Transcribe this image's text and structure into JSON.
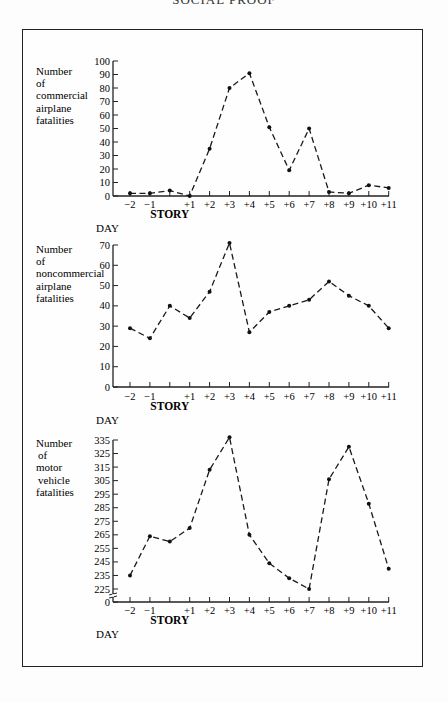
{
  "header": {
    "running_title": "SOCIAL PROOF"
  },
  "x_axis": {
    "tick_labels": [
      "−2",
      "−1",
      "",
      "+1",
      "+2",
      "+3",
      "+4",
      "+5",
      "+6",
      "+7",
      "+8",
      "+9",
      "+10",
      "+11"
    ],
    "day_values": [
      -2,
      -1,
      0,
      1,
      2,
      3,
      4,
      5,
      6,
      7,
      8,
      9,
      10,
      11
    ],
    "story_label": "STORY",
    "day_label": "DAY"
  },
  "charts": [
    {
      "y_label_lines": [
        "Number",
        "of",
        "commercial",
        "airplane",
        "fatalities"
      ],
      "y_ticks": [
        "100",
        "90",
        "80",
        "70",
        "60",
        "50",
        "40",
        "30",
        "20",
        "10",
        "0"
      ]
    },
    {
      "y_label_lines": [
        "Number",
        "of",
        "noncommercial",
        "airplane",
        "fatalities"
      ],
      "y_ticks": [
        "70",
        "60",
        "50",
        "40",
        "30",
        "20",
        "10",
        "0"
      ]
    },
    {
      "y_label_lines": [
        "Number",
        "of",
        "motor",
        "vehicle",
        "fatalities"
      ],
      "y_ticks": [
        "335",
        "325",
        "315",
        "305",
        "295",
        "285",
        "275",
        "265",
        "255",
        "245",
        "235",
        "225",
        "0"
      ]
    }
  ],
  "chart_data": [
    {
      "type": "line",
      "title": "",
      "xlabel": "DAY",
      "ylabel": "Number of commercial airplane fatalities",
      "x": [
        -2,
        -1,
        0,
        1,
        2,
        3,
        4,
        5,
        6,
        7,
        8,
        9,
        10,
        11
      ],
      "x_tick_labels": [
        "−2",
        "−1",
        "STORY",
        "+1",
        "+2",
        "+3",
        "+4",
        "+5",
        "+6",
        "+7",
        "+8",
        "+9",
        "+10",
        "+11"
      ],
      "series": [
        {
          "name": "Commercial airplane fatalities",
          "values": [
            2,
            2,
            4,
            0,
            35,
            80,
            91,
            51,
            19,
            50,
            3,
            2,
            8,
            6
          ]
        }
      ],
      "ylim": [
        0,
        100
      ],
      "grid": false,
      "line_style": "dashed with point markers"
    },
    {
      "type": "line",
      "title": "",
      "xlabel": "DAY",
      "ylabel": "Number of noncommercial airplane fatalities",
      "x": [
        -2,
        -1,
        0,
        1,
        2,
        3,
        4,
        5,
        6,
        7,
        8,
        9,
        10,
        11
      ],
      "x_tick_labels": [
        "−2",
        "−1",
        "STORY",
        "+1",
        "+2",
        "+3",
        "+4",
        "+5",
        "+6",
        "+7",
        "+8",
        "+9",
        "+10",
        "+11"
      ],
      "series": [
        {
          "name": "Noncommercial airplane fatalities",
          "values": [
            29,
            24,
            40,
            34,
            47,
            71,
            27,
            37,
            40,
            43,
            52,
            45,
            40,
            29
          ]
        }
      ],
      "ylim": [
        0,
        70
      ],
      "grid": false,
      "line_style": "dashed with point markers"
    },
    {
      "type": "line",
      "title": "",
      "xlabel": "DAY",
      "ylabel": "Number of motor vehicle fatalities",
      "x": [
        -2,
        -1,
        0,
        1,
        2,
        3,
        4,
        5,
        6,
        7,
        8,
        9,
        10,
        11
      ],
      "x_tick_labels": [
        "−2",
        "−1",
        "STORY",
        "+1",
        "+2",
        "+3",
        "+4",
        "+5",
        "+6",
        "+7",
        "+8",
        "+9",
        "+10",
        "+11"
      ],
      "series": [
        {
          "name": "Motor vehicle fatalities",
          "values": [
            235,
            264,
            260,
            270,
            313,
            337,
            265,
            244,
            233,
            225,
            306,
            330,
            288,
            240
          ]
        }
      ],
      "ylim": [
        225,
        335
      ],
      "axis_break": "y-axis broken between 0 and 225",
      "grid": false,
      "line_style": "dashed with point markers"
    }
  ]
}
